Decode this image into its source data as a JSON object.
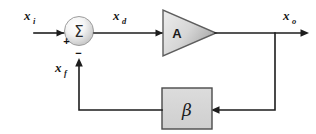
{
  "diagram": {
    "background_color": "#ffffff",
    "line_color": "#1d1d1d",
    "labels": {
      "input_signal": "x",
      "input_signal_sub": "i",
      "difference_signal": "x",
      "difference_signal_sub": "d",
      "output_signal": "x",
      "output_signal_sub": "o",
      "feedback_signal": "x",
      "feedback_signal_sub": "f"
    },
    "summing_junction": {
      "symbol": "Σ",
      "plus_sign": "+",
      "minus_sign": "−",
      "fill_light": "#fdfdfd",
      "fill_dark": "#c9c9c9",
      "stroke": "#9a9a9a"
    },
    "amplifier": {
      "label": "A",
      "fill_light": "#f2f2f2",
      "fill_dark": "#b4b4b4",
      "stroke": "#5e5e5e"
    },
    "feedback_block": {
      "label": "β",
      "fill": "#d4d4d4",
      "stroke": "#4a4a4a"
    }
  }
}
